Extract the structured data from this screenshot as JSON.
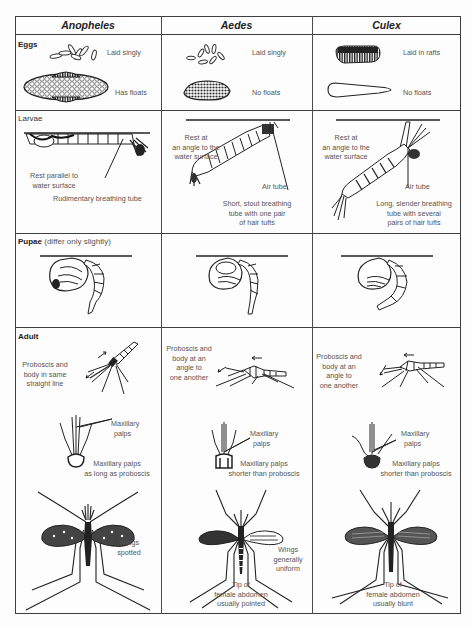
{
  "columns": [
    "Anopheles",
    "Aedes",
    "Culex"
  ],
  "rows": {
    "eggs": {
      "title": "Eggs",
      "anopheles": {
        "laying": "Laid singly",
        "floats": "Has floats"
      },
      "aedes": {
        "laying": "Laid singly",
        "floats": "No floats"
      },
      "culex": {
        "laying": "Laid in rafts",
        "floats": "No floats"
      }
    },
    "larvae": {
      "title": "Larvae",
      "anopheles": {
        "position": "Rest parallel to water surface",
        "position_l1": "Rest parallel to",
        "position_l2": "water surface",
        "tube": "Rudimentary breathing tube"
      },
      "aedes": {
        "position_l1": "Rest at",
        "position_l2": "an angle to the",
        "position_l3": "water surface",
        "air_tube": "Air tube",
        "tube_l1": "Short, stout breathing",
        "tube_l2": "tube with one pair",
        "tube_l3": "of hair tufts"
      },
      "culex": {
        "position_l1": "Rest at",
        "position_l2": "an angle to the",
        "position_l3": "water surface",
        "air_tube": "Air tube",
        "tube_l1": "Long, slender breathing",
        "tube_l2": "tube with several",
        "tube_l3": "pairs of hair tufts"
      }
    },
    "pupae": {
      "title": "Pupae",
      "subtitle": "(differ only slightly)"
    },
    "adult": {
      "title": "Adult",
      "anopheles": {
        "posture_l1": "Proboscis and",
        "posture_l2": "body in same",
        "posture_l3": "straight line",
        "palps_l1": "Maxillary",
        "palps_l2": "palps",
        "palps_len_l1": "Maxillary palps",
        "palps_len_l2": "as long as proboscis",
        "wings_l1": "Wings",
        "wings_l2": "spotted"
      },
      "aedes": {
        "posture_l1": "Proboscis and",
        "posture_l2": "body at an",
        "posture_l3": "angle to",
        "posture_l4": "one another",
        "palps_l1": "Maxillary",
        "palps_l2": "palps",
        "palps_len_l1": "Maxillary palps",
        "palps_len_l2": "shorter than proboscis",
        "wings_l1": "Wings",
        "wings_l2": "generally",
        "wings_l3": "uniform",
        "tip_l1": "Tip of",
        "tip_l2": "female abdomen",
        "tip_l3": "usually pointed"
      },
      "culex": {
        "posture_l1": "Proboscis and",
        "posture_l2": "body at an",
        "posture_l3": "angle to",
        "posture_l4": "one another",
        "palps_l1": "Maxillary",
        "palps_l2": "palps",
        "palps_len_l1": "Maxillary palps",
        "palps_len_l2": "shorter than proboscis",
        "tip_l1": "Tip of",
        "tip_l2": "female abdomen",
        "tip_l3": "usually  blunt"
      }
    }
  }
}
